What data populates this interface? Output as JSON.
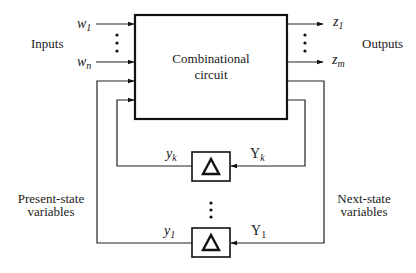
{
  "diagram": {
    "type": "sequential-circuit-block-diagram",
    "main_block": {
      "label_line1": "Combinational",
      "label_line2": "circuit"
    },
    "inputs": {
      "group_label": "Inputs",
      "first": {
        "var": "w",
        "sub": "1"
      },
      "last": {
        "var": "w",
        "sub": "n"
      }
    },
    "outputs": {
      "group_label": "Outputs",
      "first": {
        "var": "z",
        "sub": "1"
      },
      "last": {
        "var": "z",
        "sub": "m"
      }
    },
    "delay_elements": [
      {
        "symbol": "Δ",
        "present_state": {
          "var": "y",
          "sub": "k"
        },
        "next_state": {
          "var": "Y",
          "sub": "k"
        }
      },
      {
        "symbol": "Δ",
        "present_state": {
          "var": "y",
          "sub": "1"
        },
        "next_state": {
          "var": "Y",
          "sub": "1"
        }
      }
    ],
    "present_state_label": {
      "line1": "Present-state",
      "line2": "variables"
    },
    "next_state_label": {
      "line1": "Next-state",
      "line2": "variables"
    },
    "colors": {
      "stroke": "#111111",
      "background": "#ffffff"
    }
  }
}
